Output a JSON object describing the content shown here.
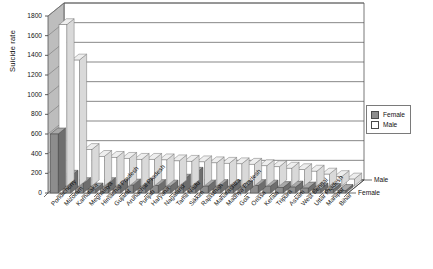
{
  "chart_data": {
    "type": "bar",
    "title": "",
    "xlabel": "",
    "ylabel": "Suicide rate",
    "ylim": [
      0,
      1800
    ],
    "yticks": [
      0,
      200,
      400,
      600,
      800,
      1000,
      1200,
      1400,
      1600,
      1800
    ],
    "grid": true,
    "legend_position": "right",
    "three_d": true,
    "depth_axis_labels": [
      "Male",
      "Female"
    ],
    "categories": [
      "Pondicherry",
      "Mizoram",
      "Karnataka",
      "Meghalaya",
      "Himachal Pradesh",
      "Gujarat",
      "Arunachal Pradesh",
      "Punjab",
      "Haryana",
      "Nagaland",
      "Tamil Nadu",
      "Sikkim",
      "Rajasthan",
      "Maharashtra",
      "Madhya Pradesh",
      "Goa",
      "Orissa",
      "Kerala",
      "Tripura",
      "Assam",
      "West Bengal",
      "Uttar Pradesh",
      "Manipur",
      "Bihar"
    ],
    "series": [
      {
        "name": "Female",
        "color": "#8d8d8d",
        "values": [
          600,
          170,
          95,
          40,
          95,
          80,
          80,
          90,
          75,
          70,
          130,
          200,
          70,
          75,
          70,
          60,
          75,
          70,
          55,
          60,
          50,
          40,
          35,
          25
        ]
      },
      {
        "name": "Male",
        "color": "#ffffff",
        "values": [
          1640,
          1280,
          370,
          300,
          290,
          280,
          270,
          270,
          265,
          255,
          250,
          245,
          235,
          230,
          225,
          220,
          205,
          195,
          180,
          165,
          150,
          120,
          95,
          70
        ]
      }
    ]
  },
  "legend": {
    "items": [
      {
        "label": "Female"
      },
      {
        "label": "Male"
      }
    ]
  },
  "axis": {
    "y_title": "Suicide rate"
  }
}
